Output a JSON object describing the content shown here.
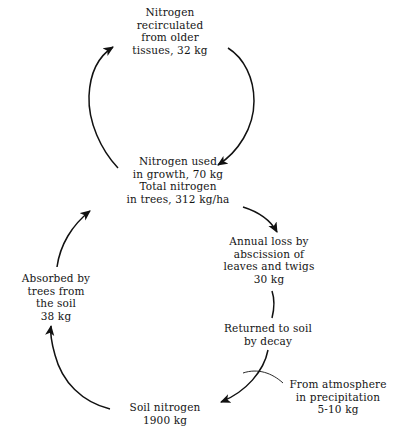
{
  "diagram": {
    "stroke_color": "#111111",
    "background_color": "#ffffff",
    "nodes": {
      "recirculated": {
        "lines": [
          "Nitrogen",
          "recirculated",
          "from older",
          "tissues, 32 kg"
        ],
        "value": "32 kg"
      },
      "growth": {
        "lines": [
          "Nitrogen used",
          "in growth, 70 kg",
          "Total nitrogen",
          "in trees, 312 kg/ha"
        ],
        "value": "70 kg",
        "total": "312 kg/ha"
      },
      "annual_loss": {
        "lines": [
          "Annual loss by",
          "abscission of",
          "leaves and twigs",
          "30 kg"
        ],
        "value": "30 kg"
      },
      "returned": {
        "lines": [
          "Returned to soil",
          "by decay"
        ],
        "value": ""
      },
      "soil_nitrogen": {
        "lines": [
          "Soil nitrogen",
          "1900 kg"
        ],
        "value": "1900 kg"
      },
      "absorbed": {
        "lines": [
          "Absorbed by",
          "trees from",
          "the soil",
          "38 kg"
        ],
        "value": "38 kg"
      },
      "atmosphere": {
        "lines": [
          "From atmosphere",
          "in precipitation",
          "5-10 kg"
        ],
        "value": "5-10 kg"
      }
    },
    "flows": [
      {
        "name": "growth-to-recirculated",
        "from": "growth",
        "to": "recirculated",
        "label": "32 kg"
      },
      {
        "name": "recirculated-to-growth",
        "from": "recirculated",
        "to": "growth",
        "label": "70 kg"
      },
      {
        "name": "growth-to-annual-loss",
        "from": "growth",
        "to": "annual_loss",
        "label": "30 kg"
      },
      {
        "name": "annual-loss-to-returned",
        "from": "annual_loss",
        "to": "returned",
        "label": ""
      },
      {
        "name": "returned-to-soil",
        "from": "returned",
        "to": "soil_nitrogen",
        "label": ""
      },
      {
        "name": "atmosphere-to-soil",
        "from": "atmosphere",
        "to": "soil_nitrogen",
        "label": "5-10 kg"
      },
      {
        "name": "soil-to-absorbed",
        "from": "soil_nitrogen",
        "to": "absorbed",
        "label": "38 kg"
      },
      {
        "name": "absorbed-to-growth",
        "from": "absorbed",
        "to": "growth",
        "label": ""
      }
    ]
  }
}
